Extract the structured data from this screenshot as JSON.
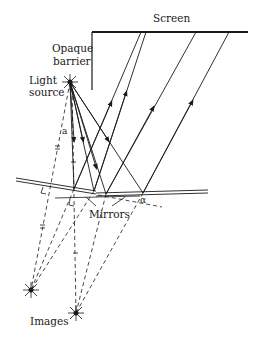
{
  "diagram": {
    "labels": {
      "screen": "Screen",
      "barrier_line1": "Opaque",
      "barrier_line2": "barrier",
      "source_line1": "Light",
      "source_line2": "source",
      "mirrors": "Mirrors",
      "images": "Images",
      "angle": "α",
      "distance": "a"
    },
    "colors": {
      "ink": "#1a1a1a",
      "background": "#ffffff"
    }
  }
}
